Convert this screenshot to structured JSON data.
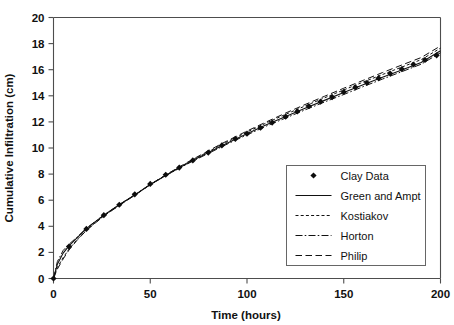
{
  "chart_data": {
    "type": "line",
    "title": "",
    "xlabel": "Time (hours)",
    "ylabel": "Cumulative Infiltration (cm)",
    "xlim": [
      0,
      200
    ],
    "ylim": [
      0,
      20
    ],
    "xticks": [
      0,
      50,
      100,
      150,
      200
    ],
    "yticks": [
      0,
      2,
      4,
      6,
      8,
      10,
      12,
      14,
      16,
      18,
      20
    ],
    "grid": false,
    "legend_position": "lower-right",
    "legend_entries": [
      {
        "label": "Clay Data",
        "style": "marker",
        "marker": "diamond"
      },
      {
        "label": "Green and Ampt",
        "style": "solid"
      },
      {
        "label": "Kostiakov",
        "style": "dotted"
      },
      {
        "label": "Horton",
        "style": "dashdot"
      },
      {
        "label": "Philip",
        "style": "dashed"
      }
    ],
    "series": [
      {
        "name": "Clay Data",
        "style": "marker",
        "x": [
          0,
          8,
          17,
          26,
          34,
          42,
          50,
          58,
          65,
          72,
          80,
          87,
          94,
          100,
          107,
          113,
          120,
          126,
          132,
          138,
          144,
          150,
          156,
          162,
          168,
          174,
          180,
          186,
          192,
          198
        ],
        "y": [
          0.0,
          2.45,
          3.8,
          4.85,
          5.65,
          6.45,
          7.25,
          7.95,
          8.5,
          9.05,
          9.65,
          10.2,
          10.7,
          11.1,
          11.55,
          11.95,
          12.4,
          12.8,
          13.2,
          13.55,
          13.9,
          14.3,
          14.65,
          15.0,
          15.35,
          15.7,
          16.05,
          16.4,
          16.75,
          17.1
        ]
      },
      {
        "name": "Green and Ampt",
        "style": "solid",
        "x": [
          0,
          2,
          5,
          8,
          12,
          17,
          22,
          26,
          34,
          42,
          50,
          58,
          65,
          72,
          80,
          87,
          94,
          100,
          110,
          120,
          130,
          140,
          150,
          160,
          170,
          180,
          190,
          200
        ],
        "y": [
          0.0,
          1.1,
          1.95,
          2.5,
          3.1,
          3.82,
          4.4,
          4.85,
          5.65,
          6.4,
          7.2,
          7.9,
          8.48,
          9.05,
          9.65,
          10.18,
          10.68,
          11.1,
          11.78,
          12.42,
          13.05,
          13.65,
          14.25,
          14.85,
          15.42,
          15.98,
          16.55,
          17.45
        ]
      },
      {
        "name": "Kostiakov",
        "style": "dotted",
        "x": [
          0,
          2,
          5,
          8,
          12,
          17,
          22,
          26,
          34,
          42,
          50,
          58,
          65,
          72,
          80,
          87,
          94,
          100,
          110,
          120,
          130,
          140,
          150,
          160,
          170,
          180,
          190,
          200
        ],
        "y": [
          0.0,
          0.85,
          1.6,
          2.25,
          2.95,
          3.72,
          4.32,
          4.8,
          5.62,
          6.4,
          7.2,
          7.92,
          8.52,
          9.1,
          9.72,
          10.27,
          10.78,
          11.22,
          11.92,
          12.58,
          13.22,
          13.84,
          14.45,
          15.05,
          15.63,
          16.2,
          16.77,
          17.65
        ]
      },
      {
        "name": "Horton",
        "style": "dashdot",
        "x": [
          0,
          2,
          5,
          8,
          12,
          17,
          22,
          26,
          34,
          42,
          50,
          58,
          65,
          72,
          80,
          87,
          94,
          100,
          110,
          120,
          130,
          140,
          150,
          160,
          170,
          180,
          190,
          200
        ],
        "y": [
          0.0,
          1.3,
          2.15,
          2.62,
          3.15,
          3.85,
          4.42,
          4.86,
          5.66,
          6.42,
          7.2,
          7.88,
          8.45,
          9.0,
          9.58,
          10.1,
          10.6,
          11.0,
          11.68,
          12.3,
          12.92,
          13.52,
          14.1,
          14.7,
          15.28,
          15.85,
          16.42,
          17.3
        ]
      },
      {
        "name": "Philip",
        "style": "dashed",
        "x": [
          0,
          2,
          5,
          8,
          12,
          17,
          22,
          26,
          34,
          42,
          50,
          58,
          65,
          72,
          80,
          87,
          94,
          100,
          110,
          120,
          130,
          140,
          150,
          160,
          170,
          180,
          190,
          200
        ],
        "y": [
          0.0,
          0.72,
          1.5,
          2.18,
          2.9,
          3.68,
          4.3,
          4.78,
          5.6,
          6.38,
          7.2,
          7.94,
          8.55,
          9.14,
          9.78,
          10.34,
          10.86,
          11.3,
          12.0,
          12.68,
          13.33,
          13.96,
          14.58,
          15.18,
          15.78,
          16.36,
          16.93,
          17.82
        ]
      }
    ]
  },
  "axes": {
    "x_tick_labels": [
      "0",
      "50",
      "100",
      "150",
      "200"
    ],
    "y_tick_labels": [
      "0",
      "2",
      "4",
      "6",
      "8",
      "10",
      "12",
      "14",
      "16",
      "18",
      "20"
    ],
    "x_title": "Time (hours)",
    "y_title": "Cumulative Infiltration (cm)"
  },
  "legend": {
    "items": [
      "Clay Data",
      "Green and Ampt",
      "Kostiakov",
      "Horton",
      "Philip"
    ]
  },
  "colors": {
    "line": "#111111",
    "marker": "#0d0d0d",
    "axis": "#4d4d4d",
    "legend_border": "#666666",
    "background": "#ffffff"
  }
}
